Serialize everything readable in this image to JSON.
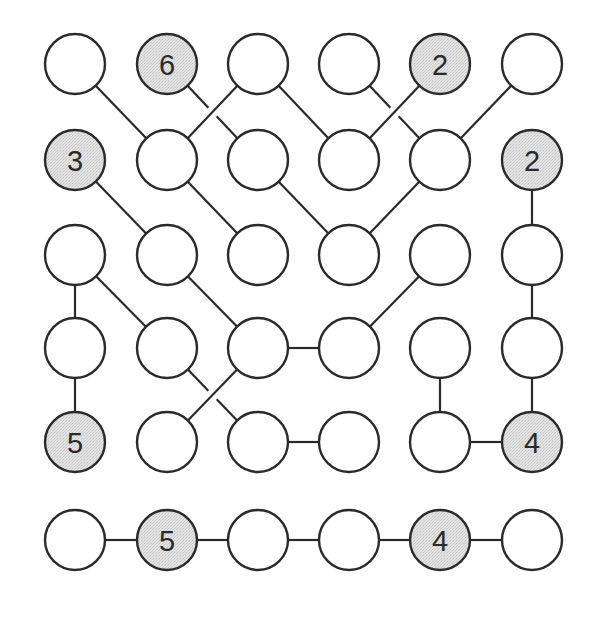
{
  "puzzle": {
    "type": "hashi-like number-link diagram",
    "rows": 6,
    "cols": 6,
    "colors": {
      "line": "#2a2a2a",
      "plain_fill": "#ffffff",
      "clue_fill": "#dcdcdc"
    },
    "geometry": {
      "col_x": [
        75,
        167,
        258,
        349,
        440,
        532
      ],
      "row_y": [
        64,
        160,
        255,
        348,
        442,
        540
      ],
      "radius": 30
    },
    "clues": [
      {
        "row": 0,
        "col": 1,
        "value": "6"
      },
      {
        "row": 0,
        "col": 4,
        "value": "2"
      },
      {
        "row": 1,
        "col": 0,
        "value": "3"
      },
      {
        "row": 1,
        "col": 5,
        "value": "2"
      },
      {
        "row": 4,
        "col": 0,
        "value": "5"
      },
      {
        "row": 4,
        "col": 5,
        "value": "4"
      },
      {
        "row": 5,
        "col": 1,
        "value": "5"
      },
      {
        "row": 5,
        "col": 4,
        "value": "4"
      }
    ],
    "edges": [
      {
        "from": [
          0,
          0
        ],
        "to": [
          1,
          1
        ]
      },
      {
        "from": [
          0,
          1
        ],
        "to": [
          1,
          2
        ],
        "under": true
      },
      {
        "from": [
          0,
          2
        ],
        "to": [
          1,
          1
        ]
      },
      {
        "from": [
          0,
          2
        ],
        "to": [
          1,
          3
        ]
      },
      {
        "from": [
          0,
          3
        ],
        "to": [
          1,
          4
        ],
        "under": true
      },
      {
        "from": [
          0,
          4
        ],
        "to": [
          1,
          3
        ]
      },
      {
        "from": [
          0,
          5
        ],
        "to": [
          1,
          4
        ]
      },
      {
        "from": [
          1,
          0
        ],
        "to": [
          2,
          1
        ]
      },
      {
        "from": [
          1,
          1
        ],
        "to": [
          2,
          2
        ]
      },
      {
        "from": [
          1,
          2
        ],
        "to": [
          2,
          3
        ]
      },
      {
        "from": [
          1,
          4
        ],
        "to": [
          2,
          3
        ]
      },
      {
        "from": [
          1,
          5
        ],
        "to": [
          2,
          5
        ]
      },
      {
        "from": [
          2,
          0
        ],
        "to": [
          3,
          0
        ]
      },
      {
        "from": [
          2,
          0
        ],
        "to": [
          3,
          1
        ]
      },
      {
        "from": [
          2,
          1
        ],
        "to": [
          3,
          2
        ]
      },
      {
        "from": [
          2,
          4
        ],
        "to": [
          3,
          3
        ]
      },
      {
        "from": [
          2,
          5
        ],
        "to": [
          3,
          5
        ]
      },
      {
        "from": [
          3,
          0
        ],
        "to": [
          4,
          0
        ]
      },
      {
        "from": [
          3,
          1
        ],
        "to": [
          4,
          2
        ],
        "under": true
      },
      {
        "from": [
          3,
          2
        ],
        "to": [
          3,
          3
        ]
      },
      {
        "from": [
          3,
          2
        ],
        "to": [
          4,
          1
        ]
      },
      {
        "from": [
          3,
          4
        ],
        "to": [
          4,
          4
        ]
      },
      {
        "from": [
          3,
          5
        ],
        "to": [
          4,
          5
        ]
      },
      {
        "from": [
          4,
          2
        ],
        "to": [
          4,
          3
        ]
      },
      {
        "from": [
          4,
          4
        ],
        "to": [
          4,
          5
        ]
      },
      {
        "from": [
          5,
          0
        ],
        "to": [
          5,
          1
        ]
      },
      {
        "from": [
          5,
          1
        ],
        "to": [
          5,
          2
        ]
      },
      {
        "from": [
          5,
          2
        ],
        "to": [
          5,
          3
        ]
      },
      {
        "from": [
          5,
          3
        ],
        "to": [
          5,
          4
        ]
      },
      {
        "from": [
          5,
          4
        ],
        "to": [
          5,
          5
        ]
      }
    ]
  }
}
